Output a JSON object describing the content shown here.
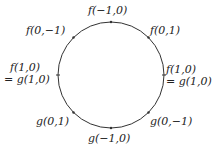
{
  "diagram": {
    "circle": {
      "cx": 111,
      "cy": 75,
      "r": 53,
      "stroke": "#333333"
    },
    "labels": {
      "top": "f(−1,0)",
      "top_right": "f(0,1)",
      "top_left": "f(0,−1)",
      "right_line1": "f(1,0)",
      "right_line2": "= g(1,0)",
      "left_line1": "f(1,0)",
      "left_line2": "= g(1,0)",
      "bottom_left": "g(0,1)",
      "bottom": "g(−1,0)",
      "bottom_right": "g(0,−1)"
    }
  }
}
